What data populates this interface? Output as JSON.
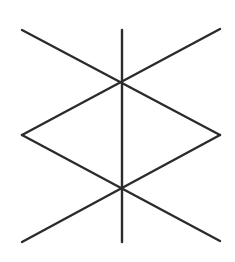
{
  "diagram": {
    "stroke_color": "#2b2b2b",
    "background": "#ffffff",
    "stroke_width": 2.4,
    "lines": [
      {
        "id": "vertical-staff",
        "x1": 122,
        "y1": 30,
        "x2": 122,
        "y2": 242
      },
      {
        "id": "upper-left-diagonal",
        "x1": 22,
        "y1": 30,
        "x2": 220,
        "y2": 135
      },
      {
        "id": "upper-right-diagonal",
        "x1": 220,
        "y1": 29,
        "x2": 22,
        "y2": 135
      },
      {
        "id": "lower-left-diagonal",
        "x1": 22,
        "y1": 135,
        "x2": 220,
        "y2": 241
      },
      {
        "id": "lower-right-diagonal",
        "x1": 220,
        "y1": 135,
        "x2": 22,
        "y2": 242
      }
    ]
  }
}
